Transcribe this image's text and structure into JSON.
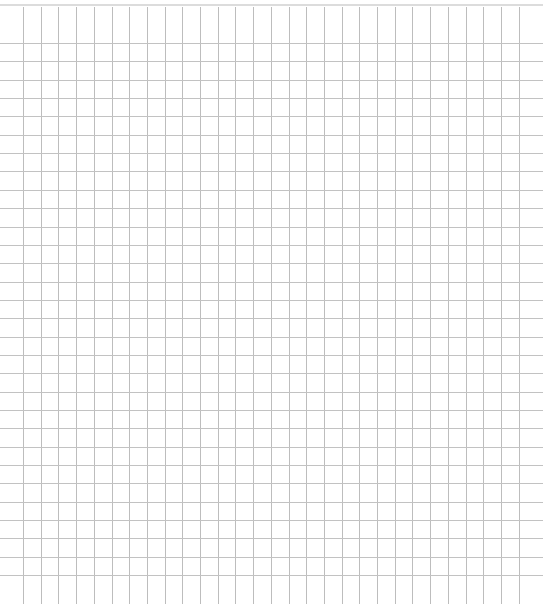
{
  "document": {
    "type": "grid-paper",
    "background_color": "#ffffff",
    "line_color": "#bdbdbd",
    "edge_color": "#dcdcdc"
  },
  "grid": {
    "vertical": {
      "count": 29,
      "first_x": 23,
      "spacing": 17.7,
      "top": 7,
      "bottom": 604
    },
    "horizontal": {
      "count": 30,
      "first_y": 43,
      "spacing": 18.35,
      "left": 0,
      "right": 543
    }
  }
}
